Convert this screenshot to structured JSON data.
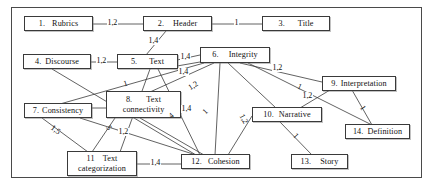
{
  "diagram": {
    "frame": {
      "visible": true
    },
    "nodes": [
      {
        "id": "n1",
        "number": "1.",
        "label": "Rubrics",
        "label2": ""
      },
      {
        "id": "n2",
        "number": "2.",
        "label": "Header",
        "label2": ""
      },
      {
        "id": "n3",
        "number": "3.",
        "label": "Title",
        "label2": ""
      },
      {
        "id": "n4",
        "number": "4.",
        "label": "Discourse",
        "label2": ""
      },
      {
        "id": "n5",
        "number": "5.",
        "label": "Text",
        "label2": ""
      },
      {
        "id": "n6",
        "number": "6.",
        "label": "Integrity",
        "label2": ""
      },
      {
        "id": "n7",
        "number": "7.",
        "label": "Consistency",
        "label2": ""
      },
      {
        "id": "n8",
        "number": "8.",
        "label": "Text",
        "label2": "connectivity"
      },
      {
        "id": "n9",
        "number": "9.",
        "label": "Interpretation",
        "label2": ""
      },
      {
        "id": "n10",
        "number": "10.",
        "label": "Narrative",
        "label2": ""
      },
      {
        "id": "n11",
        "number": "11",
        "label": "Text",
        "label2": "categorization"
      },
      {
        "id": "n12",
        "number": "12.",
        "label": "Cohesion",
        "label2": ""
      },
      {
        "id": "n13",
        "number": "13.",
        "label": "Story",
        "label2": ""
      },
      {
        "id": "n14",
        "number": "14.",
        "label": "Definition",
        "label2": ""
      }
    ],
    "edge_labels": [
      {
        "id": "e1",
        "text": "1,2"
      },
      {
        "id": "e2",
        "text": "1"
      },
      {
        "id": "e3",
        "text": "1,4"
      },
      {
        "id": "e4",
        "text": "1,2"
      },
      {
        "id": "e5",
        "text": "1,4"
      },
      {
        "id": "e6",
        "text": "1,4"
      },
      {
        "id": "e7",
        "text": "1,2"
      },
      {
        "id": "e8",
        "text": "1,4"
      },
      {
        "id": "e9",
        "text": "4"
      },
      {
        "id": "e10",
        "text": "1"
      },
      {
        "id": "e11",
        "text": "1,2"
      },
      {
        "id": "e12",
        "text": "1"
      },
      {
        "id": "e13",
        "text": "1,2"
      },
      {
        "id": "e14",
        "text": "1,5"
      },
      {
        "id": "e15",
        "text": "5"
      },
      {
        "id": "e16",
        "text": "1,2"
      },
      {
        "id": "e17",
        "text": "1,4"
      },
      {
        "id": "e18",
        "text": "1"
      },
      {
        "id": "e19",
        "text": "1"
      },
      {
        "id": "e20",
        "text": "1,2"
      },
      {
        "id": "e21",
        "text": "1"
      }
    ]
  },
  "colors": {
    "stroke": "#3a3a3a",
    "text": "#111111",
    "background": "#ffffff"
  }
}
